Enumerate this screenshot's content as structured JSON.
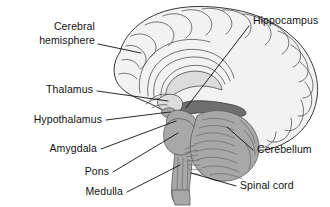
{
  "figure": {
    "background_color": "#ffffff",
    "width": 330,
    "height": 207
  },
  "palette": {
    "line": "#111111",
    "outline": "#3a3a3a",
    "cortex_fill": "#f2f2f2",
    "light_gray": "#dcdcdc",
    "mid_gray": "#a8a8a8",
    "dark_gray": "#6e6e6e",
    "text": "#111111"
  },
  "labels": {
    "cerebral_hemisphere_line1": "Cerebral",
    "cerebral_hemisphere_line2": "hemisphere",
    "thalamus": "Thalamus",
    "hypothalamus": "Hypothalamus",
    "amygdala": "Amygdala",
    "pons": "Pons",
    "medulla": "Medulla",
    "hippocampus": "Hippocampus",
    "cerebellum": "Cerebellum",
    "spinal_cord": "Spinal cord"
  },
  "structures": [
    {
      "name": "cerebral-hemisphere",
      "label": "Cerebral hemisphere",
      "side": "left",
      "shade": "light"
    },
    {
      "name": "thalamus",
      "label": "Thalamus",
      "side": "left",
      "shade": "light"
    },
    {
      "name": "hypothalamus",
      "label": "Hypothalamus",
      "side": "left",
      "shade": "light"
    },
    {
      "name": "amygdala",
      "label": "Amygdala",
      "side": "left",
      "shade": "mid"
    },
    {
      "name": "pons",
      "label": "Pons",
      "side": "left",
      "shade": "mid"
    },
    {
      "name": "medulla",
      "label": "Medulla",
      "side": "left",
      "shade": "mid"
    },
    {
      "name": "hippocampus",
      "label": "Hippocampus",
      "side": "right",
      "shade": "dark"
    },
    {
      "name": "cerebellum",
      "label": "Cerebellum",
      "side": "right",
      "shade": "mid"
    },
    {
      "name": "spinal-cord",
      "label": "Spinal cord",
      "side": "right",
      "shade": "mid"
    }
  ]
}
